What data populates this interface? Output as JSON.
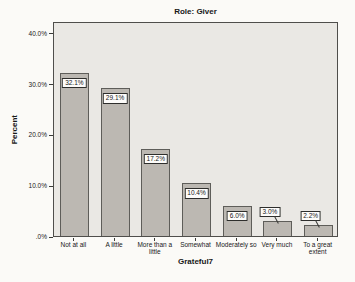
{
  "chart_data": {
    "type": "bar",
    "title": "Role: Giver",
    "xlabel": "Grateful7",
    "ylabel": "Percent",
    "categories": [
      "Not at all",
      "A little",
      "More than a little",
      "Somewhat",
      "Moderately so",
      "Very much",
      "To a great extent"
    ],
    "values": [
      32.1,
      29.1,
      17.2,
      10.4,
      6.0,
      3.0,
      2.2
    ],
    "value_labels": [
      "32.1%",
      "29.1%",
      "17.2%",
      "10.4%",
      "6.0%",
      "3.0%",
      "2.2%"
    ],
    "yticks": [
      40,
      30,
      20,
      10,
      0
    ],
    "ytick_labels": [
      "40.0%",
      "30.0%",
      "20.0%",
      "10.0%",
      ".0%"
    ],
    "ylim": [
      0,
      42.3
    ],
    "grid": false,
    "legend": "none",
    "label_inside_threshold": 5,
    "colors": {
      "page_bg": "#fbfaf7",
      "plot_bg": "#eae8e4",
      "bar_fill": "#bcb8b2",
      "bar_border": "#5e5d59",
      "frame": "#4f4e4b",
      "label_box_bg": "#fdfcfa",
      "text": "#181818"
    }
  }
}
